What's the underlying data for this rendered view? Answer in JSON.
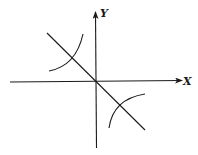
{
  "diagram": {
    "type": "coordinate-sketch",
    "axes": {
      "x_label": "X",
      "y_label": "Y"
    },
    "elements": [
      {
        "name": "line",
        "description": "straight line through origin with negative slope (y = -x)"
      },
      {
        "name": "curve-branch-q2",
        "description": "arc segment in second quadrant, crossing the line"
      },
      {
        "name": "curve-branch-q4",
        "description": "arc segment in fourth quadrant, crossing the line"
      }
    ],
    "colors": {
      "ink": "#1a1a1a",
      "background": "#ffffff"
    }
  }
}
